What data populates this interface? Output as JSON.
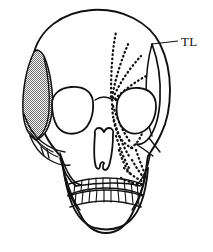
{
  "figure": {
    "background_color": "#ffffff",
    "ink_color": "#111111",
    "shade_color": "#8f8f8f",
    "width": 213,
    "height": 252
  },
  "annotations": [
    {
      "id": "temporal-line",
      "label": "TL",
      "meaning": "temporal line",
      "label_x": 182,
      "label_y": 45,
      "leader_from_x": 178,
      "leader_from_y": 41,
      "leader_to_x": 152,
      "leader_to_y": 44
    }
  ],
  "regions": {
    "shaded_temporal_patch": {
      "name": "shaded-temporalis-patch",
      "side": "left",
      "fill": "stipple",
      "shade_color": "#8f8f8f"
    },
    "dotted_muscle_fan": {
      "name": "dotted-temporalis-fan",
      "side": "right",
      "line_count": 4,
      "style": "dotted"
    },
    "dotted_orbit_rim": {
      "name": "dotted-orbit-and-maxilla-outline",
      "side": "right",
      "style": "dotted"
    }
  },
  "anatomy": {
    "cranium": "cranial-vault",
    "orbit_left": "left-orbit",
    "orbit_right": "right-orbit",
    "nasal_aperture": "nasal-aperture",
    "zygomatic_left": "left-zygomatic-arch",
    "zygomatic_right": "right-zygomatic-arch",
    "maxilla": "maxilla",
    "mandible": "mandible",
    "teeth_upper_count": 11,
    "teeth_lower_count": 11
  }
}
